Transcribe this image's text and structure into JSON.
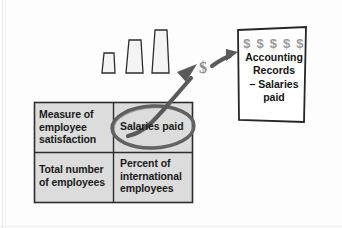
{
  "diagram": {
    "colors": {
      "cell_fill": "#dcdcdc",
      "chimney_fill": "#f2f2f2",
      "outline": "#2b2b2b",
      "ellipse": "#5a5a5a",
      "arrow": "#5a5a5a",
      "dollar_gray": "#9a9a9a",
      "page_background": "#ffffff"
    },
    "factory": {
      "name": "factory-illustration",
      "chimneys": [
        {
          "name": "chimney-short",
          "label": ""
        },
        {
          "name": "chimney-medium",
          "label": ""
        },
        {
          "name": "chimney-tall",
          "label": ""
        }
      ]
    },
    "table": {
      "name": "measures-table",
      "rows": [
        {
          "cells": [
            {
              "name": "cell-measure-of-employee-satisfaction",
              "lines": [
                "Measure of",
                "employee",
                "satisfaction"
              ],
              "highlighted": false
            },
            {
              "name": "cell-salaries-paid",
              "lines": [
                "Salaries paid"
              ],
              "highlighted": true
            }
          ]
        },
        {
          "cells": [
            {
              "name": "cell-total-number-of-employees",
              "lines": [
                "Total number",
                "of employees"
              ],
              "highlighted": false
            },
            {
              "name": "cell-percent-of-international-employees",
              "lines": [
                "Percent of",
                "international",
                "employees"
              ],
              "highlighted": false
            }
          ]
        }
      ]
    },
    "highlight": {
      "name": "salaries-paid-ellipse",
      "target": "Salaries paid"
    },
    "flow_arrow": {
      "name": "salaries-to-records-arrow",
      "from": "Salaries paid",
      "to": "Accounting Records"
    },
    "money_marker": {
      "name": "dollar-sign-marker",
      "symbol": "$"
    },
    "entry_arrow": {
      "name": "dollar-to-document-arrow"
    },
    "document": {
      "name": "accounting-records-document",
      "dollar_row": "$ $ $ $ $",
      "title_lines": [
        "Accounting",
        "Records"
      ],
      "entry_lines": [
        "– Salaries",
        "paid"
      ]
    }
  }
}
